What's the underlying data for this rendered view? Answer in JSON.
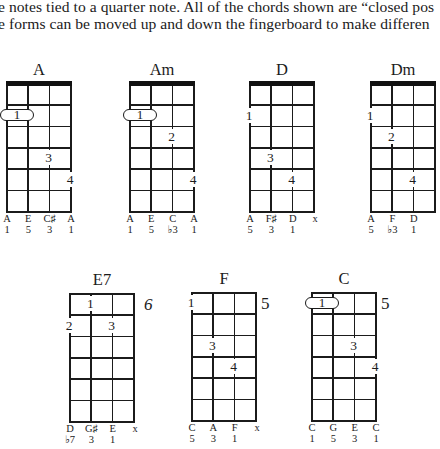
{
  "text": {
    "line1": "e notes tied to a quarter note. All of the chords shown are “closed pos",
    "line2": "e forms can be moved up and down the fingerboard to make differen"
  },
  "chords": [
    {
      "name": "A",
      "notes": [
        "A",
        "E",
        "C♯",
        "A"
      ],
      "degrees": [
        "1",
        "5",
        "3",
        "1"
      ],
      "fingers": [
        {
          "label": "1",
          "string": 1,
          "fret": 2,
          "barre": "strings 1-2"
        },
        {
          "label": "3",
          "string": 3,
          "fret": 4
        },
        {
          "label": "4",
          "string": 4,
          "fret": 5
        }
      ]
    },
    {
      "name": "Am",
      "notes": [
        "A",
        "E",
        "C",
        "A"
      ],
      "degrees": [
        "1",
        "5",
        "♭3",
        "1"
      ],
      "fingers": [
        {
          "label": "1",
          "string": 1,
          "fret": 2,
          "barre": "strings 1-2"
        },
        {
          "label": "2",
          "string": 3,
          "fret": 3
        },
        {
          "label": "4",
          "string": 4,
          "fret": 5
        }
      ]
    },
    {
      "name": "D",
      "notes": [
        "A",
        "F♯",
        "D",
        "x"
      ],
      "degrees": [
        "5",
        "3",
        "1"
      ],
      "fingers": [
        {
          "label": "1",
          "string": 1,
          "fret": 2
        },
        {
          "label": "3",
          "string": 2,
          "fret": 4
        },
        {
          "label": "4",
          "string": 3,
          "fret": 5
        }
      ]
    },
    {
      "name": "Dm",
      "notes": [
        "A",
        "F",
        "D"
      ],
      "degrees": [
        "5",
        "♭3",
        "1"
      ],
      "fingers": [
        {
          "label": "1",
          "string": 1,
          "fret": 2
        },
        {
          "label": "2",
          "string": 2,
          "fret": 3
        },
        {
          "label": "4",
          "string": 3,
          "fret": 5
        }
      ]
    },
    {
      "name": "E7",
      "position": "6",
      "notes": [
        "D",
        "G♯",
        "E",
        "x"
      ],
      "degrees": [
        "♭7",
        "3",
        "1"
      ],
      "fingers": [
        {
          "label": "1",
          "string": 2,
          "fret": 1
        },
        {
          "label": "2",
          "string": 1,
          "fret": 2
        },
        {
          "label": "3",
          "string": 3,
          "fret": 2
        }
      ]
    },
    {
      "name": "F",
      "position": "5",
      "notes": [
        "C",
        "A",
        "F",
        "x"
      ],
      "degrees": [
        "5",
        "3",
        "1"
      ],
      "fingers": [
        {
          "label": "1",
          "string": 1,
          "fret": 1
        },
        {
          "label": "3",
          "string": 2,
          "fret": 3
        },
        {
          "label": "4",
          "string": 3,
          "fret": 4
        }
      ]
    },
    {
      "name": "C",
      "position": "5",
      "notes": [
        "C",
        "G",
        "E",
        "C"
      ],
      "degrees": [
        "1",
        "5",
        "3",
        "1"
      ],
      "fingers": [
        {
          "label": "1",
          "string": 1,
          "fret": 1,
          "barre": "strings 1-2"
        },
        {
          "label": "3",
          "string": 3,
          "fret": 3
        },
        {
          "label": "4",
          "string": 4,
          "fret": 4
        }
      ]
    }
  ]
}
